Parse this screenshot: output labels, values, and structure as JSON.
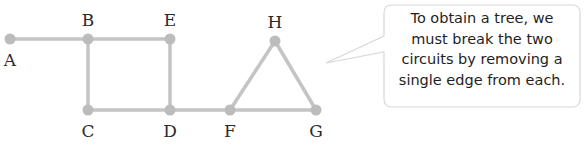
{
  "diagram": {
    "type": "graph",
    "nodes": [
      {
        "id": "A",
        "label": "A",
        "x": 10,
        "y": 39,
        "label_pos": "below"
      },
      {
        "id": "B",
        "label": "B",
        "x": 88,
        "y": 39,
        "label_pos": "above"
      },
      {
        "id": "E",
        "label": "E",
        "x": 170,
        "y": 39,
        "label_pos": "above"
      },
      {
        "id": "H",
        "label": "H",
        "x": 275,
        "y": 41,
        "label_pos": "above"
      },
      {
        "id": "C",
        "label": "C",
        "x": 88,
        "y": 110,
        "label_pos": "below"
      },
      {
        "id": "D",
        "label": "D",
        "x": 170,
        "y": 110,
        "label_pos": "below"
      },
      {
        "id": "F",
        "label": "F",
        "x": 230,
        "y": 110,
        "label_pos": "below"
      },
      {
        "id": "G",
        "label": "G",
        "x": 316,
        "y": 110,
        "label_pos": "below"
      }
    ],
    "edges": [
      [
        "A",
        "B"
      ],
      [
        "B",
        "E"
      ],
      [
        "B",
        "C"
      ],
      [
        "E",
        "D"
      ],
      [
        "C",
        "D"
      ],
      [
        "D",
        "F"
      ],
      [
        "F",
        "H"
      ],
      [
        "H",
        "G"
      ],
      [
        "F",
        "G"
      ]
    ],
    "colors": {
      "edge": "#c4c4c4",
      "node": "#bcbcbc",
      "bubble_border": "#d8d8d8"
    }
  },
  "callout": {
    "lines": [
      "To obtain a tree, we",
      "must break the two",
      "circuits by removing a",
      "single edge from each."
    ]
  }
}
